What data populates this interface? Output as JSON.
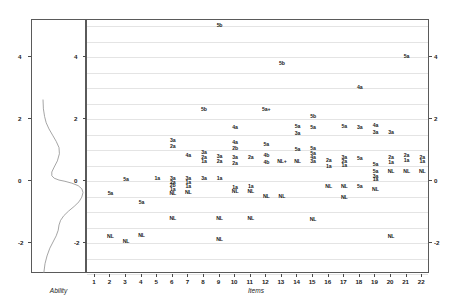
{
  "figure": {
    "type": "wright-map",
    "left_panel_title": "Ability",
    "bottom_axis_title": "Items"
  },
  "chart_data": {
    "type": "scatter",
    "title": "",
    "subtitle": "",
    "xlabel": "Items",
    "ylabel": "",
    "left_panel_label": "Ability",
    "xlim": [
      0.5,
      22.5
    ],
    "ylim": [
      -3.0,
      5.2
    ],
    "grid": true,
    "gridlines_y": [
      -3.0,
      -2.5,
      -2.0,
      -1.5,
      -1.0,
      -0.5,
      0.0,
      0.5,
      1.0,
      1.5,
      2.0,
      2.5,
      3.0,
      3.5,
      4.0,
      4.5,
      5.0
    ],
    "legend_position": "none",
    "y_ticks": [
      "4",
      "2",
      "0",
      "-2"
    ],
    "y_tick_values": [
      4,
      2,
      0,
      -2
    ],
    "x_ticks": [
      "1",
      "2",
      "3",
      "4",
      "5",
      "6",
      "7",
      "8",
      "9",
      "10",
      "11",
      "12",
      "13",
      "14",
      "15",
      "16",
      "17",
      "18",
      "19",
      "20",
      "21",
      "22"
    ],
    "x_tick_values": [
      1,
      2,
      3,
      4,
      5,
      6,
      7,
      8,
      9,
      10,
      11,
      12,
      13,
      14,
      15,
      16,
      17,
      18,
      19,
      20,
      21,
      22
    ],
    "density_curve": {
      "label": "Ability distribution",
      "color": "#8e8e8e",
      "points": [
        [
          -3.0,
          0.02
        ],
        [
          -2.7,
          0.05
        ],
        [
          -2.45,
          0.1
        ],
        [
          -2.2,
          0.17
        ],
        [
          -2.0,
          0.25
        ],
        [
          -1.8,
          0.33
        ],
        [
          -1.62,
          0.38
        ],
        [
          -1.45,
          0.4
        ],
        [
          -1.3,
          0.44
        ],
        [
          -1.15,
          0.52
        ],
        [
          -1.0,
          0.64
        ],
        [
          -0.85,
          0.78
        ],
        [
          -0.7,
          0.9
        ],
        [
          -0.55,
          0.97
        ],
        [
          -0.4,
          1.0
        ],
        [
          -0.28,
          0.97
        ],
        [
          -0.18,
          0.88
        ],
        [
          -0.1,
          0.72
        ],
        [
          -0.04,
          0.55
        ],
        [
          0.0,
          0.4
        ],
        [
          0.06,
          0.28
        ],
        [
          0.14,
          0.22
        ],
        [
          0.26,
          0.22
        ],
        [
          0.42,
          0.28
        ],
        [
          0.62,
          0.36
        ],
        [
          0.85,
          0.41
        ],
        [
          1.05,
          0.4
        ],
        [
          1.25,
          0.33
        ],
        [
          1.45,
          0.24
        ],
        [
          1.65,
          0.15
        ],
        [
          1.85,
          0.08
        ],
        [
          2.05,
          0.04
        ],
        [
          2.3,
          0.01
        ],
        [
          2.6,
          0.0
        ]
      ]
    },
    "points": [
      {
        "item": 9,
        "y": 5.0,
        "label": "5b"
      },
      {
        "item": 13,
        "y": 3.78,
        "label": "5b"
      },
      {
        "item": 21,
        "y": 4.0,
        "label": "5a"
      },
      {
        "item": 18,
        "y": 3.02,
        "label": "4a"
      },
      {
        "item": 8,
        "y": 2.3,
        "label": "5b"
      },
      {
        "item": 12,
        "y": 2.3,
        "label": "5a+"
      },
      {
        "item": 15,
        "y": 2.08,
        "label": "5b"
      },
      {
        "item": 10,
        "y": 1.72,
        "label": "4a"
      },
      {
        "item": 14,
        "y": 1.74,
        "label": "5a"
      },
      {
        "item": 14,
        "y": 1.52,
        "label": "3a"
      },
      {
        "item": 15,
        "y": 1.7,
        "label": "5a"
      },
      {
        "item": 17,
        "y": 1.74,
        "label": "5a"
      },
      {
        "item": 18,
        "y": 1.7,
        "label": "3a"
      },
      {
        "item": 19,
        "y": 1.78,
        "label": "4a"
      },
      {
        "item": 19,
        "y": 1.56,
        "label": "3a"
      },
      {
        "item": 20,
        "y": 1.56,
        "label": "3a"
      },
      {
        "item": 6,
        "y": 1.3,
        "label": "3a"
      },
      {
        "item": 6,
        "y": 1.1,
        "label": "2a"
      },
      {
        "item": 10,
        "y": 1.24,
        "label": "4a"
      },
      {
        "item": 10,
        "y": 1.04,
        "label": "2b"
      },
      {
        "item": 12,
        "y": 1.18,
        "label": "5a"
      },
      {
        "item": 7,
        "y": 0.8,
        "label": "4a"
      },
      {
        "item": 8,
        "y": 0.92,
        "label": "3a"
      },
      {
        "item": 8,
        "y": 0.76,
        "label": "2a"
      },
      {
        "item": 8,
        "y": 0.62,
        "label": "1a"
      },
      {
        "item": 9,
        "y": 0.78,
        "label": "3a"
      },
      {
        "item": 9,
        "y": 0.62,
        "label": "2a"
      },
      {
        "item": 10,
        "y": 0.76,
        "label": "3a"
      },
      {
        "item": 10,
        "y": 0.56,
        "label": "2a"
      },
      {
        "item": 11,
        "y": 0.76,
        "label": "2a"
      },
      {
        "item": 12,
        "y": 0.82,
        "label": "4b"
      },
      {
        "item": 12,
        "y": 0.58,
        "label": "4b"
      },
      {
        "item": 13,
        "y": 0.62,
        "label": "NL+"
      },
      {
        "item": 14,
        "y": 1.0,
        "label": "5a"
      },
      {
        "item": 14,
        "y": 0.62,
        "label": "NL"
      },
      {
        "item": 15,
        "y": 1.04,
        "label": "5a"
      },
      {
        "item": 15,
        "y": 0.86,
        "label": "5a"
      },
      {
        "item": 15,
        "y": 0.74,
        "label": "4a"
      },
      {
        "item": 15,
        "y": 0.62,
        "label": "3a"
      },
      {
        "item": 16,
        "y": 0.64,
        "label": "2a"
      },
      {
        "item": 16,
        "y": 0.44,
        "label": "1a"
      },
      {
        "item": 17,
        "y": 0.76,
        "label": "3a"
      },
      {
        "item": 17,
        "y": 0.62,
        "label": "2a"
      },
      {
        "item": 17,
        "y": 0.5,
        "label": "1a"
      },
      {
        "item": 18,
        "y": 0.72,
        "label": "5a"
      },
      {
        "item": 19,
        "y": 0.52,
        "label": "5a"
      },
      {
        "item": 20,
        "y": 0.74,
        "label": "2a"
      },
      {
        "item": 20,
        "y": 0.58,
        "label": "1a"
      },
      {
        "item": 21,
        "y": 0.82,
        "label": "2a"
      },
      {
        "item": 21,
        "y": 0.66,
        "label": "1a"
      },
      {
        "item": 22,
        "y": 0.76,
        "label": "2a"
      },
      {
        "item": 22,
        "y": 0.62,
        "label": "1a"
      },
      {
        "item": 3,
        "y": 0.04,
        "label": "5a"
      },
      {
        "item": 5,
        "y": 0.08,
        "label": "1a"
      },
      {
        "item": 6,
        "y": 0.06,
        "label": "3a"
      },
      {
        "item": 6,
        "y": -0.06,
        "label": "2a"
      },
      {
        "item": 6,
        "y": -0.16,
        "label": "2b"
      },
      {
        "item": 6,
        "y": -0.28,
        "label": "1a"
      },
      {
        "item": 6,
        "y": -0.42,
        "label": "NL"
      },
      {
        "item": 7,
        "y": 0.06,
        "label": "3a"
      },
      {
        "item": 7,
        "y": -0.06,
        "label": "1a"
      },
      {
        "item": 7,
        "y": -0.18,
        "label": "1a"
      },
      {
        "item": 7,
        "y": -0.4,
        "label": "NL"
      },
      {
        "item": 8,
        "y": 0.08,
        "label": "3a"
      },
      {
        "item": 9,
        "y": 0.08,
        "label": "1a"
      },
      {
        "item": 10,
        "y": -0.22,
        "label": "1a"
      },
      {
        "item": 10,
        "y": -0.36,
        "label": "NL"
      },
      {
        "item": 11,
        "y": -0.2,
        "label": "1a"
      },
      {
        "item": 11,
        "y": -0.36,
        "label": "NL"
      },
      {
        "item": 16,
        "y": -0.18,
        "label": "NL"
      },
      {
        "item": 17,
        "y": -0.18,
        "label": "NL"
      },
      {
        "item": 18,
        "y": -0.18,
        "label": "5a"
      },
      {
        "item": 19,
        "y": 0.28,
        "label": "5a"
      },
      {
        "item": 19,
        "y": 0.14,
        "label": "3a"
      },
      {
        "item": 19,
        "y": 0.02,
        "label": "1a"
      },
      {
        "item": 19,
        "y": -0.3,
        "label": "NL"
      },
      {
        "item": 20,
        "y": 0.3,
        "label": "NL"
      },
      {
        "item": 21,
        "y": 0.3,
        "label": "NL"
      },
      {
        "item": 22,
        "y": 0.3,
        "label": "NL"
      },
      {
        "item": 2,
        "y": -0.42,
        "label": "5a"
      },
      {
        "item": 4,
        "y": -0.72,
        "label": "5a"
      },
      {
        "item": 12,
        "y": -0.52,
        "label": "NL"
      },
      {
        "item": 13,
        "y": -0.52,
        "label": "NL"
      },
      {
        "item": 17,
        "y": -0.54,
        "label": "NL"
      },
      {
        "item": 6,
        "y": -1.22,
        "label": "NL"
      },
      {
        "item": 9,
        "y": -1.22,
        "label": "NL"
      },
      {
        "item": 11,
        "y": -1.22,
        "label": "NL"
      },
      {
        "item": 15,
        "y": -1.26,
        "label": "NL"
      },
      {
        "item": 2,
        "y": -1.8,
        "label": "NL"
      },
      {
        "item": 4,
        "y": -1.76,
        "label": "NL"
      },
      {
        "item": 3,
        "y": -1.98,
        "label": "NL"
      },
      {
        "item": 9,
        "y": -1.9,
        "label": "NL"
      },
      {
        "item": 20,
        "y": -1.8,
        "label": "NL"
      }
    ]
  }
}
